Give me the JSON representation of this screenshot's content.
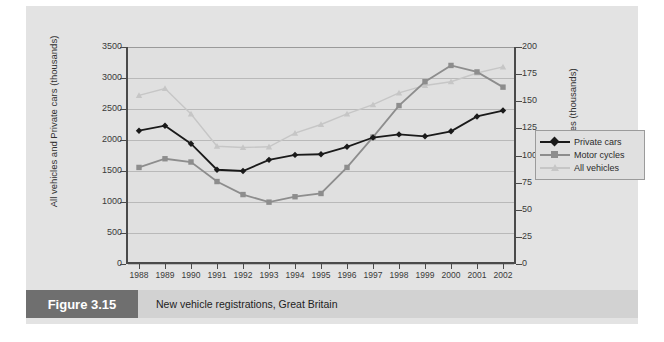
{
  "figure": {
    "tag": "Figure 3.15",
    "caption": "New vehicle registrations, Great Britain"
  },
  "colors": {
    "private_cars": "#1a1a1a",
    "motor_cycles": "#8d8d8d",
    "all_vehicles": "#c6c6c6",
    "panel_bg": "#e3e3e3",
    "plot_bg": "#e0e0e0",
    "grid": "#b9b9b9",
    "axis": "#4a4a4a",
    "caption_tag_bg": "#6f6f6f",
    "caption_bar_bg": "#d2d2d2"
  },
  "legend": {
    "position": "right-middle",
    "items": [
      {
        "label": "Private cars",
        "marker": "diamond",
        "color": "#1a1a1a"
      },
      {
        "label": "Motor cycles",
        "marker": "square",
        "color": "#8d8d8d"
      },
      {
        "label": "All vehicles",
        "marker": "triangle",
        "color": "#c6c6c6"
      }
    ]
  },
  "axes": {
    "left": {
      "title": "All vehicles and Private cars (thousands)",
      "ticks": [
        "3500",
        "3000",
        "2500",
        "2000",
        "1500",
        "1000",
        "500",
        "0"
      ],
      "min": 0,
      "max": 3500,
      "step": 500
    },
    "right": {
      "title": "Motor cycles (thousands)",
      "ticks": [
        "200",
        "175",
        "150",
        "125",
        "100",
        "75",
        "50",
        "25",
        "0"
      ],
      "min": 0,
      "max": 200,
      "step": 25
    },
    "bottom": {
      "title": "",
      "ticks": [
        "1988",
        "1989",
        "1990",
        "1991",
        "1992",
        "1993",
        "1994",
        "1995",
        "1996",
        "1997",
        "1998",
        "1999",
        "2000",
        "2001",
        "2002"
      ]
    }
  },
  "chart_data": {
    "type": "line",
    "title": "New vehicle registrations, Great Britain",
    "xlabel": "",
    "ylabel": "All vehicles and Private cars (thousands)",
    "ylabel_secondary": "Motor cycles (thousands)",
    "categories": [
      "1988",
      "1989",
      "1990",
      "1991",
      "1992",
      "1993",
      "1994",
      "1995",
      "1996",
      "1997",
      "1998",
      "1999",
      "2000",
      "2001",
      "2002"
    ],
    "ylim": [
      0,
      3500
    ],
    "ylim_secondary": [
      0,
      200
    ],
    "grid": true,
    "legend_position": "right",
    "series": [
      {
        "name": "Private cars",
        "axis": "left",
        "marker": "diamond",
        "color": "#1a1a1a",
        "values": [
          2150,
          2230,
          1940,
          1520,
          1500,
          1680,
          1760,
          1770,
          1890,
          2040,
          2090,
          2060,
          2140,
          2380,
          2475
        ]
      },
      {
        "name": "Motor cycles",
        "axis": "right",
        "marker": "square",
        "color": "#8d8d8d",
        "values": [
          89,
          97,
          94,
          76,
          64,
          57,
          62,
          65,
          89,
          117,
          146,
          168,
          183,
          177,
          163
        ]
      },
      {
        "name": "All vehicles",
        "axis": "left",
        "marker": "triangle",
        "color": "#c6c6c6",
        "values": [
          2720,
          2830,
          2420,
          1900,
          1880,
          1890,
          2110,
          2250,
          2420,
          2570,
          2760,
          2880,
          2940,
          3080,
          3180
        ]
      }
    ]
  }
}
